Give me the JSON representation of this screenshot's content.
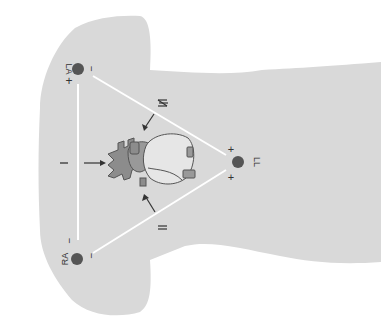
{
  "figure": {
    "colors": {
      "background": "#ffffff",
      "body": "#d9d9d9",
      "lead_line": "#ffffff",
      "electrode": "#555555",
      "heart_dark": "#8c8c8c",
      "heart_light": "#e6e6e6",
      "outline": "#555555",
      "text": "#333333"
    },
    "electrodes": [
      {
        "id": "LA",
        "label": "LA",
        "x": 79,
        "y": 69,
        "pos_sign": "+",
        "neg_sign": "−"
      },
      {
        "id": "RA",
        "label": "RA",
        "x": 77,
        "y": 259,
        "pos_sign": "",
        "neg_sign": "−"
      },
      {
        "id": "LL",
        "label": "LL",
        "x": 238,
        "y": 162,
        "pos_sign": "+",
        "neg_sign": "+"
      }
    ],
    "leads": [
      {
        "id": "I",
        "label": "I"
      },
      {
        "id": "II",
        "label": "II"
      },
      {
        "id": "III",
        "label": "III"
      }
    ],
    "signs": {
      "la_plus": "+",
      "la_minus": "−",
      "ra_minus_top": "−",
      "ra_minus_side": "−",
      "ll_plus_top": "+",
      "ll_plus_bottom": "+"
    }
  }
}
